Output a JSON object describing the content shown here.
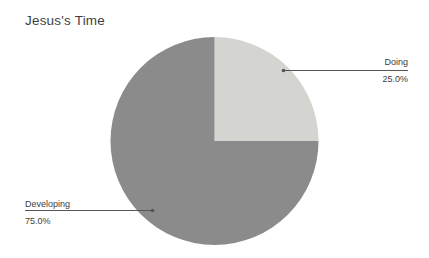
{
  "title": "Jesus's Time",
  "chart_data": {
    "type": "pie",
    "title": "Jesus's Time",
    "slices": [
      {
        "label": "Doing",
        "value": 25.0,
        "display_percent": "25.0%",
        "color": "#d4d4d1"
      },
      {
        "label": "Developing",
        "value": 75.0,
        "display_percent": "75.0%",
        "color": "#8b8b8b"
      }
    ],
    "start_angle": "12-o'clock",
    "direction": "clockwise",
    "legend_position": "none",
    "label_style": "outside-with-leader-lines",
    "grid": false
  },
  "colors": {
    "background": "#ffffff",
    "title_text": "#3f3f3f",
    "label_text": "#404040",
    "leader_line": "#555555"
  }
}
